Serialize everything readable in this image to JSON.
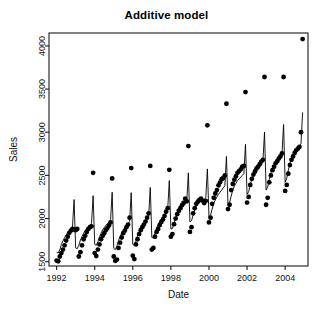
{
  "chart_data": {
    "type": "line",
    "title": "Additive model",
    "xlabel": "Date",
    "ylabel": "Sales",
    "xlim": [
      1991.6,
      2005.2
    ],
    "ylim": [
      1450,
      4150
    ],
    "grid": false,
    "legend": null,
    "xticks": [
      1992,
      1994,
      1996,
      1998,
      2000,
      2002,
      2004
    ],
    "xticklabels": [
      "1992",
      "1994",
      "1996",
      "1998",
      "2000",
      "2002",
      "2004"
    ],
    "yticks": [
      1500,
      2000,
      2500,
      3000,
      3500,
      4000
    ],
    "yticklabels": [
      "1500",
      "2000",
      "2500",
      "3000",
      "3500",
      "4000"
    ],
    "series": [
      {
        "name": "observed",
        "marker": "filled-circle",
        "color": "#000000",
        "x": [
          1992.0,
          1992.083,
          1992.167,
          1992.25,
          1992.333,
          1992.417,
          1992.5,
          1992.583,
          1992.667,
          1992.75,
          1992.833,
          1992.917,
          1993.0,
          1993.083,
          1993.167,
          1993.25,
          1993.333,
          1993.417,
          1993.5,
          1993.583,
          1993.667,
          1993.75,
          1993.833,
          1993.917,
          1994.0,
          1994.083,
          1994.167,
          1994.25,
          1994.333,
          1994.417,
          1994.5,
          1994.583,
          1994.667,
          1994.75,
          1994.833,
          1994.917,
          1995.0,
          1995.083,
          1995.167,
          1995.25,
          1995.333,
          1995.417,
          1995.5,
          1995.583,
          1995.667,
          1995.75,
          1995.833,
          1995.917,
          1996.0,
          1996.083,
          1996.167,
          1996.25,
          1996.333,
          1996.417,
          1996.5,
          1996.583,
          1996.667,
          1996.75,
          1996.833,
          1996.917,
          1997.0,
          1997.083,
          1997.167,
          1997.25,
          1997.333,
          1997.417,
          1997.5,
          1997.583,
          1997.667,
          1997.75,
          1997.833,
          1997.917,
          1998.0,
          1998.083,
          1998.167,
          1998.25,
          1998.333,
          1998.417,
          1998.5,
          1998.583,
          1998.667,
          1998.75,
          1998.833,
          1998.917,
          1999.0,
          1999.083,
          1999.167,
          1999.25,
          1999.333,
          1999.417,
          1999.5,
          1999.583,
          1999.667,
          1999.75,
          1999.833,
          1999.917,
          2000.0,
          2000.083,
          2000.167,
          2000.25,
          2000.333,
          2000.417,
          2000.5,
          2000.583,
          2000.667,
          2000.75,
          2000.833,
          2000.917,
          2001.0,
          2001.083,
          2001.167,
          2001.25,
          2001.333,
          2001.417,
          2001.5,
          2001.583,
          2001.667,
          2001.75,
          2001.833,
          2001.917,
          2002.0,
          2002.083,
          2002.167,
          2002.25,
          2002.333,
          2002.417,
          2002.5,
          2002.583,
          2002.667,
          2002.75,
          2002.833,
          2002.917,
          2003.0,
          2003.083,
          2003.167,
          2003.25,
          2003.333,
          2003.417,
          2003.5,
          2003.583,
          2003.667,
          2003.75,
          2003.833,
          2003.917,
          2004.0,
          2004.083,
          2004.167,
          2004.25,
          2004.333,
          2004.417,
          2004.5,
          2004.583,
          2004.667,
          2004.75,
          2004.833,
          2004.917
        ],
        "y": [
          1513,
          1505,
          1560,
          1600,
          1640,
          1690,
          1745,
          1790,
          1835,
          1860,
          1880,
          1870,
          1865,
          1880,
          1560,
          1610,
          1690,
          1760,
          1800,
          1845,
          1880,
          1900,
          1910,
          2530,
          1600,
          1565,
          1640,
          1700,
          1760,
          1800,
          1830,
          1865,
          1890,
          1920,
          1955,
          2465,
          1560,
          1510,
          1525,
          1660,
          1720,
          1780,
          1830,
          1860,
          1900,
          1930,
          2010,
          2585,
          1570,
          1530,
          1700,
          1760,
          1820,
          1865,
          1900,
          1930,
          1965,
          2010,
          2060,
          2610,
          1640,
          1660,
          1790,
          1845,
          1880,
          1925,
          1960,
          1990,
          2030,
          2080,
          2120,
          2565,
          1790,
          1820,
          1935,
          2000,
          2050,
          2090,
          2120,
          2155,
          2180,
          2230,
          2200,
          2840,
          1845,
          1900,
          2060,
          2120,
          2170,
          2195,
          2215,
          2230,
          2205,
          2180,
          2205,
          3080,
          1955,
          2010,
          2170,
          2240,
          2290,
          2330,
          2385,
          2420,
          2455,
          2470,
          2500,
          3330,
          2110,
          2160,
          2330,
          2400,
          2450,
          2490,
          2530,
          2550,
          2570,
          2600,
          2610,
          3465,
          2185,
          2250,
          2390,
          2460,
          2510,
          2545,
          2580,
          2600,
          2630,
          2660,
          2680,
          3640,
          2160,
          2240,
          2420,
          2500,
          2560,
          2600,
          2640,
          2665,
          2695,
          2720,
          2755,
          3640,
          2320,
          2390,
          2520,
          2620,
          2680,
          2720,
          2760,
          2790,
          2810,
          2830,
          3000,
          4080
        ]
      },
      {
        "name": "fitted additive model",
        "marker": "none",
        "color": "#000000",
        "x": [
          1992.0,
          1992.083,
          1992.167,
          1992.25,
          1992.333,
          1992.417,
          1992.5,
          1992.583,
          1992.667,
          1992.75,
          1992.833,
          1992.917,
          1993.0,
          1993.083,
          1993.167,
          1993.25,
          1993.333,
          1993.417,
          1993.5,
          1993.583,
          1993.667,
          1993.75,
          1993.833,
          1993.917,
          1994.0,
          1994.083,
          1994.167,
          1994.25,
          1994.333,
          1994.417,
          1994.5,
          1994.583,
          1994.667,
          1994.75,
          1994.833,
          1994.917,
          1995.0,
          1995.083,
          1995.167,
          1995.25,
          1995.333,
          1995.417,
          1995.5,
          1995.583,
          1995.667,
          1995.75,
          1995.833,
          1995.917,
          1996.0,
          1996.083,
          1996.167,
          1996.25,
          1996.333,
          1996.417,
          1996.5,
          1996.583,
          1996.667,
          1996.75,
          1996.833,
          1996.917,
          1997.0,
          1997.083,
          1997.167,
          1997.25,
          1997.333,
          1997.417,
          1997.5,
          1997.583,
          1997.667,
          1997.75,
          1997.833,
          1997.917,
          1998.0,
          1998.083,
          1998.167,
          1998.25,
          1998.333,
          1998.417,
          1998.5,
          1998.583,
          1998.667,
          1998.75,
          1998.833,
          1998.917,
          1999.0,
          1999.083,
          1999.167,
          1999.25,
          1999.333,
          1999.417,
          1999.5,
          1999.583,
          1999.667,
          1999.75,
          1999.833,
          1999.917,
          2000.0,
          2000.083,
          2000.167,
          2000.25,
          2000.333,
          2000.417,
          2000.5,
          2000.583,
          2000.667,
          2000.75,
          2000.833,
          2000.917,
          2001.0,
          2001.083,
          2001.167,
          2001.25,
          2001.333,
          2001.417,
          2001.5,
          2001.583,
          2001.667,
          2001.75,
          2001.833,
          2001.917,
          2002.0,
          2002.083,
          2002.167,
          2002.25,
          2002.333,
          2002.417,
          2002.5,
          2002.583,
          2002.667,
          2002.75,
          2002.833,
          2002.917,
          2003.0,
          2003.083,
          2003.167,
          2003.25,
          2003.333,
          2003.417,
          2003.5,
          2003.583,
          2003.667,
          2003.75,
          2003.833,
          2003.917,
          2004.0,
          2004.083,
          2004.167,
          2004.25,
          2004.333,
          2004.417,
          2004.5,
          2004.583,
          2004.667,
          2004.75,
          2004.833,
          2004.917
        ],
        "y": [
          1610,
          1600,
          1640,
          1700,
          1740,
          1780,
          1810,
          1840,
          1860,
          1880,
          1900,
          2220,
          1660,
          1650,
          1690,
          1750,
          1790,
          1830,
          1860,
          1885,
          1905,
          1925,
          1945,
          2265,
          1700,
          1690,
          1730,
          1790,
          1830,
          1870,
          1895,
          1920,
          1940,
          1960,
          1985,
          2305,
          1655,
          1640,
          1680,
          1745,
          1790,
          1830,
          1860,
          1885,
          1910,
          1935,
          1965,
          2300,
          1700,
          1690,
          1740,
          1800,
          1845,
          1885,
          1915,
          1940,
          1965,
          1995,
          2025,
          2360,
          1780,
          1775,
          1830,
          1890,
          1930,
          1965,
          1995,
          2020,
          2045,
          2075,
          2105,
          2440,
          1880,
          1885,
          1945,
          2005,
          2045,
          2080,
          2105,
          2130,
          2150,
          2175,
          2195,
          2530,
          1960,
          1975,
          2040,
          2100,
          2140,
          2170,
          2190,
          2205,
          2215,
          2225,
          2240,
          2575,
          2020,
          2040,
          2110,
          2175,
          2215,
          2250,
          2280,
          2305,
          2330,
          2355,
          2380,
          2720,
          2155,
          2185,
          2260,
          2330,
          2375,
          2410,
          2440,
          2460,
          2480,
          2500,
          2520,
          2860,
          2280,
          2310,
          2390,
          2460,
          2505,
          2540,
          2570,
          2590,
          2615,
          2640,
          2665,
          3000,
          2330,
          2365,
          2455,
          2530,
          2575,
          2610,
          2640,
          2665,
          2690,
          2715,
          2745,
          3090,
          2420,
          2465,
          2560,
          2640,
          2690,
          2730,
          2760,
          2790,
          2815,
          2840,
          2870,
          3230
        ]
      }
    ]
  },
  "figure": {
    "plot_area": {
      "left": 49,
      "top": 33,
      "right": 308,
      "bottom": 266
    },
    "background": "#ffffff",
    "axis_color": "#1a1a1a",
    "marker_radius": 2.4,
    "line_width": 0.9
  }
}
